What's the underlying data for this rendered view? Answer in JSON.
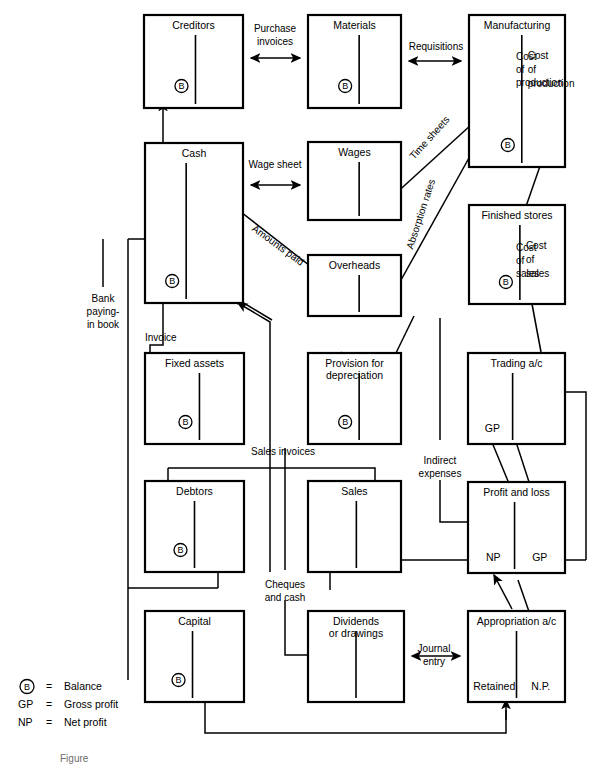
{
  "figure": {
    "caption": "Figure",
    "key": {
      "rows": [
        {
          "symbol": "B",
          "equals": "=",
          "meaning": "Balance"
        },
        {
          "symbol": "GP",
          "equals": "=",
          "meaning": "Gross profit"
        },
        {
          "symbol": "NP",
          "equals": "=",
          "meaning": "Net profit"
        }
      ]
    }
  },
  "accounts": [
    {
      "id": "creditors",
      "title": "Creditors",
      "balance": "B",
      "x": 144,
      "y": 15,
      "w": 99,
      "h": 93,
      "div": 0.52
    },
    {
      "id": "materials",
      "title": "Materials",
      "balance": "B",
      "x": 308,
      "y": 15,
      "w": 93,
      "h": 93,
      "div": 0.55
    },
    {
      "id": "manufacturing",
      "title": "Manufacturing",
      "balance": "B",
      "x": 469,
      "y": 15,
      "w": 96,
      "h": 152,
      "div": 0.55,
      "right_lines": [
        "Cost",
        "of",
        "production"
      ]
    },
    {
      "id": "cash",
      "title": "Cash",
      "balance": "B",
      "x": 145,
      "y": 143,
      "w": 98,
      "h": 160,
      "div": 0.42
    },
    {
      "id": "wages",
      "title": "Wages",
      "balance": "",
      "x": 308,
      "y": 142,
      "w": 93,
      "h": 78,
      "div": 0.55
    },
    {
      "id": "finished-stores",
      "title": "Finished stores",
      "balance": "B",
      "x": 469,
      "y": 205,
      "w": 96,
      "h": 99,
      "div": 0.53,
      "right_lines": [
        "Cost",
        "of",
        "sales"
      ]
    },
    {
      "id": "overheads",
      "title": "Overheads",
      "balance": "",
      "x": 308,
      "y": 255,
      "w": 93,
      "h": 61,
      "div": 0.55
    },
    {
      "id": "fixed-assets",
      "title": "Fixed assets",
      "balance": "B",
      "x": 145,
      "y": 353,
      "w": 99,
      "h": 91,
      "div": 0.55
    },
    {
      "id": "provision-depreciation",
      "title": "Provision for depreciation",
      "balance": "B",
      "x": 308,
      "y": 353,
      "w": 93,
      "h": 91,
      "div": 0.55,
      "two_line": true
    },
    {
      "id": "trading-ac",
      "title": "Trading a/c",
      "balance": "",
      "x": 468,
      "y": 353,
      "w": 97,
      "h": 91,
      "div": 0.46,
      "bottom_left": "GP"
    },
    {
      "id": "debtors",
      "title": "Debtors",
      "balance": "B",
      "x": 145,
      "y": 481,
      "w": 99,
      "h": 91,
      "div": 0.5
    },
    {
      "id": "sales",
      "title": "Sales",
      "balance": "",
      "x": 308,
      "y": 481,
      "w": 93,
      "h": 91,
      "div": 0.52
    },
    {
      "id": "profit-and-loss",
      "title": "Profit and loss",
      "balance": "",
      "x": 468,
      "y": 482,
      "w": 97,
      "h": 91,
      "div": 0.48,
      "bottom_left": "NP",
      "bottom_right": "GP"
    },
    {
      "id": "capital",
      "title": "Capital",
      "balance": "B",
      "x": 145,
      "y": 611,
      "w": 99,
      "h": 91,
      "div": 0.48
    },
    {
      "id": "dividends-or-drawings",
      "title": "Dividends or drawings",
      "balance": "",
      "x": 308,
      "y": 611,
      "w": 96,
      "h": 91,
      "div": 0.5,
      "two_line": true
    },
    {
      "id": "appropriation-ac",
      "title": "Appropriation a/c",
      "balance": "",
      "x": 468,
      "y": 611,
      "w": 97,
      "h": 91,
      "div": 0.5,
      "bottom_left": "Retained",
      "bottom_right": "N.P."
    }
  ],
  "flow_labels": [
    {
      "id": "purchase-invoices",
      "lines": [
        "Purchase",
        "invoices"
      ],
      "x": 275,
      "y": 32,
      "anchor": "middle"
    },
    {
      "id": "requisitions",
      "lines": [
        "Requisitions"
      ],
      "x": 436,
      "y": 50,
      "anchor": "middle"
    },
    {
      "id": "cost-of-production",
      "lines": [
        "Cost",
        "of",
        "production"
      ],
      "x": 516,
      "y": 60,
      "anchor": "start"
    },
    {
      "id": "time-sheets",
      "lines": [
        "Time sheets"
      ],
      "x": 432,
      "y": 140,
      "anchor": "middle",
      "rotate": -48
    },
    {
      "id": "wage-sheet",
      "lines": [
        "Wage sheet"
      ],
      "x": 275,
      "y": 168,
      "anchor": "middle"
    },
    {
      "id": "absorption-rates",
      "lines": [
        "Absorption rates"
      ],
      "x": 424,
      "y": 215,
      "anchor": "middle",
      "rotate": -72
    },
    {
      "id": "amounts-paid",
      "lines": [
        "Amounts paid"
      ],
      "x": 276,
      "y": 248,
      "anchor": "middle",
      "rotate": 36
    },
    {
      "id": "cost-of-sales",
      "lines": [
        "Cost",
        "of",
        "sales"
      ],
      "x": 516,
      "y": 251,
      "anchor": "start"
    },
    {
      "id": "bank-paying-in-book",
      "lines": [
        "Bank",
        "paying-",
        "in book"
      ],
      "x": 103,
      "y": 302,
      "anchor": "middle"
    },
    {
      "id": "invoice",
      "lines": [
        "Invoice"
      ],
      "x": 145,
      "y": 341,
      "anchor": "start"
    },
    {
      "id": "sales-invoices",
      "lines": [
        "Sales  invoices"
      ],
      "x": 283,
      "y": 455,
      "anchor": "middle"
    },
    {
      "id": "indirect-expenses",
      "lines": [
        "Indirect",
        "expenses"
      ],
      "x": 440,
      "y": 464,
      "anchor": "middle"
    },
    {
      "id": "cheques-and-cash",
      "lines": [
        "Cheques",
        "and cash"
      ],
      "x": 285,
      "y": 588,
      "anchor": "middle"
    },
    {
      "id": "journal-entry",
      "lines": [
        "Journal",
        "entry"
      ],
      "x": 434,
      "y": 652,
      "anchor": "middle"
    }
  ]
}
